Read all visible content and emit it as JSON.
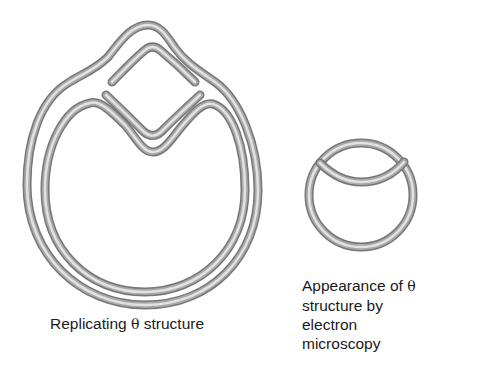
{
  "figure": {
    "left_panel": {
      "name": "replicating-theta-structure",
      "caption_prefix": "Replicating ",
      "caption_symbol": "θ",
      "caption_suffix": " structure"
    },
    "right_panel": {
      "name": "em-appearance-theta-structure",
      "caption_line1_prefix": "Appearance of ",
      "caption_symbol": "θ",
      "caption_line2": "structure by",
      "caption_line3": "electron",
      "caption_line4": "microscopy"
    },
    "colors": {
      "strand_dark": "#6e6e6e",
      "strand_light": "#d8d8d8",
      "text": "#1a1a1a",
      "background": "#ffffff"
    }
  }
}
